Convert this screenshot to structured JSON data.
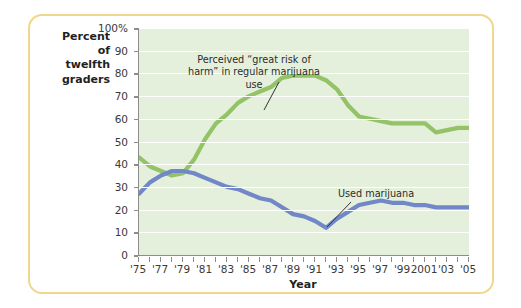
{
  "chart_data": {
    "type": "line",
    "title": "",
    "xlabel": "Year",
    "ylabel": "Percent of twelfth graders",
    "ylabel_lines": [
      "Percent",
      "of",
      "twelfth",
      "graders"
    ],
    "grid": true,
    "legend_position": "inline-annotations",
    "xlim": [
      1975,
      2005
    ],
    "ylim": [
      0,
      100
    ],
    "ytick_values": [
      0,
      10,
      20,
      30,
      40,
      50,
      60,
      70,
      80,
      90,
      100
    ],
    "ytick_labels": [
      "0",
      "10",
      "20",
      "30",
      "40",
      "50",
      "60",
      "70",
      "80",
      "90",
      "100%"
    ],
    "xtick_values": [
      1975,
      1977,
      1979,
      1981,
      1983,
      1985,
      1987,
      1989,
      1991,
      1993,
      1995,
      1997,
      1999,
      2001,
      2003,
      2005
    ],
    "xtick_labels": [
      "'75",
      "'77",
      "'79",
      "'81",
      "'83",
      "'85",
      "'87",
      "'89",
      "'91",
      "'93",
      "'95",
      "'97",
      "'99",
      "2001",
      "'03",
      "'05"
    ],
    "x": [
      1975,
      1976,
      1977,
      1978,
      1979,
      1980,
      1981,
      1982,
      1983,
      1984,
      1985,
      1986,
      1987,
      1988,
      1989,
      1990,
      1991,
      1992,
      1993,
      1994,
      1995,
      1996,
      1997,
      1998,
      1999,
      2000,
      2001,
      2002,
      2003,
      2004,
      2005
    ],
    "series": [
      {
        "name": "Perceived \"great risk of harm\" in regular marijuana use",
        "color": "#93c267",
        "values": [
          43,
          39,
          37,
          35,
          36,
          42,
          51,
          58,
          62,
          67,
          70,
          72,
          74,
          78,
          79,
          79,
          79,
          77,
          73,
          66,
          61,
          60,
          59,
          58,
          58,
          58,
          58,
          54,
          55,
          56,
          56
        ]
      },
      {
        "name": "Used marijuana",
        "color": "#7287c8",
        "values": [
          27,
          32,
          35,
          37,
          37,
          36,
          34,
          32,
          30,
          29,
          27,
          25,
          24,
          21,
          18,
          17,
          15,
          12,
          16,
          19,
          22,
          23,
          24,
          23,
          23,
          22,
          22,
          21,
          21,
          21,
          21
        ]
      }
    ],
    "annotations": [
      {
        "id": "risk",
        "text": "Perceived “great risk of\nharm” in regular marijuana use",
        "points_to_year": 1987,
        "points_to_value": 74
      },
      {
        "id": "used",
        "text": "Used marijuana",
        "points_to_year": 1988,
        "points_to_value": 21
      }
    ]
  },
  "style": {
    "plot_background": "#e4efdc",
    "gridline_color": "#ffffff",
    "frame_border": "#f0d78c",
    "axis_color": "#8c8c8c",
    "green": "#93c267",
    "blue": "#7287c8"
  }
}
